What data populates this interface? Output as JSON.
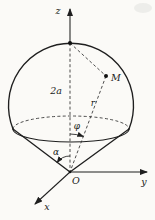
{
  "figure": {
    "description_colors": {
      "background": "#fbfaf7",
      "ink": "#1f1f1f"
    },
    "labels": {
      "z_axis": "z",
      "y_axis": "y",
      "x_axis": "x",
      "origin": "O",
      "point_m": "M",
      "radius_r": "r",
      "diameter_2a": "2a",
      "angle_phi": "φ",
      "angle_alpha": "α"
    }
  }
}
